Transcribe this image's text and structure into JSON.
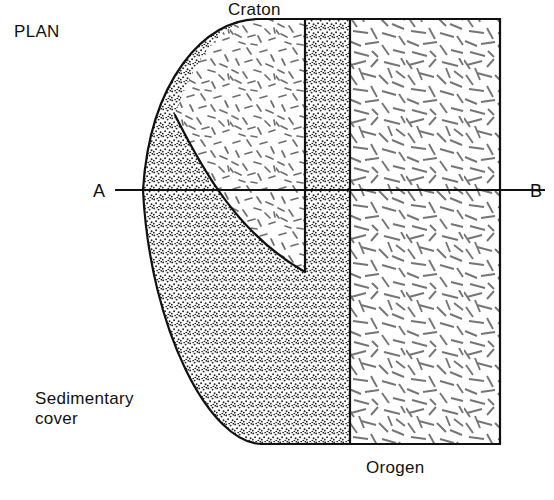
{
  "figure": {
    "kind": "geological-plan-diagram",
    "title": "PLAN",
    "labels": {
      "plan": "PLAN",
      "craton": "Craton",
      "sedimentary_cover": "Sedimentary",
      "sedimentary_cover_line2": "cover",
      "orogen": "Orogen",
      "section_start": "A",
      "section_end": "B"
    },
    "colors": {
      "ink": "#111111",
      "background": "#ffffff",
      "stipple": "#2a2a2a",
      "dash": "#6b6b6b"
    },
    "regions": [
      {
        "name": "craton",
        "label": "Craton",
        "pattern": "short-random-dashes",
        "note": "central massif, bounded by inner arc"
      },
      {
        "name": "sedimentary-cover",
        "label": "Sedimentary cover",
        "pattern": "stipple-dots",
        "note": "wraps around craton margin and forms vertical band"
      },
      {
        "name": "orogen",
        "label": "Orogen",
        "pattern": "long-random-dashes",
        "note": "right-hand rectangular belt"
      }
    ],
    "section_line": {
      "start_label": "A",
      "end_label": "B",
      "y": 190
    }
  }
}
